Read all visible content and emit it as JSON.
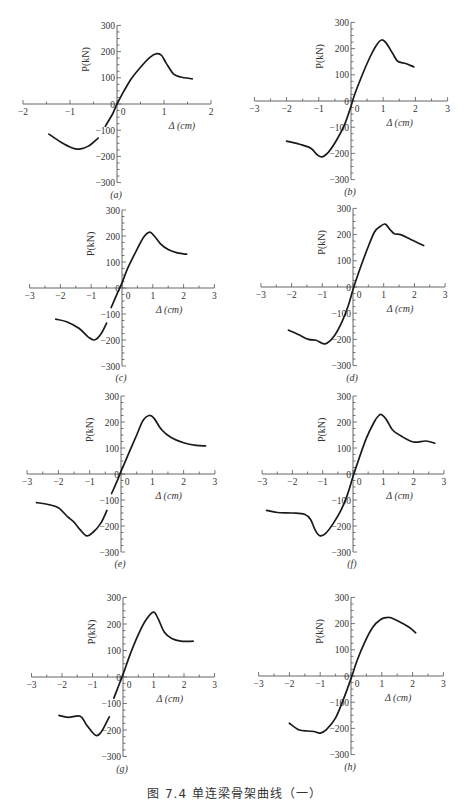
{
  "figure": {
    "caption": "图 7.4  单连梁骨架曲线（一）"
  },
  "chart_data": [
    {
      "panel": "(a)",
      "type": "line",
      "xlabel": "Δ (cm)",
      "ylabel": "P(kN)",
      "xlim": [
        -2,
        2
      ],
      "ylim": [
        -300,
        300
      ],
      "xticks": [
        -2,
        -1,
        0,
        1,
        2
      ],
      "yticks": [
        300,
        200,
        100,
        0,
        -100,
        -200,
        -300
      ],
      "grid": false,
      "frame": {
        "ox": 117,
        "oy": 104,
        "sx": 47,
        "sy": 0.262
      },
      "segments": [
        [
          [
            -1.45,
            -115
          ],
          [
            -1.2,
            -145
          ],
          [
            -0.95,
            -168
          ],
          [
            -0.8,
            -172
          ],
          [
            -0.6,
            -160
          ],
          [
            -0.4,
            -130
          ]
        ],
        [
          [
            -0.25,
            -85
          ],
          [
            -0.1,
            -40
          ],
          [
            0,
            0
          ],
          [
            0.15,
            50
          ],
          [
            0.3,
            95
          ],
          [
            0.5,
            140
          ],
          [
            0.7,
            178
          ],
          [
            0.85,
            192
          ],
          [
            0.95,
            185
          ],
          [
            1.05,
            155
          ],
          [
            1.2,
            115
          ],
          [
            1.35,
            103
          ],
          [
            1.6,
            96
          ]
        ]
      ]
    },
    {
      "panel": "(b)",
      "type": "line",
      "xlabel": "Δ (cm)",
      "ylabel": "P(kN)",
      "xlim": [
        -3,
        3
      ],
      "ylim": [
        -300,
        300
      ],
      "xticks": [
        -3,
        -2,
        -1,
        0,
        1,
        2,
        3
      ],
      "yticks": [
        300,
        200,
        100,
        0,
        -100,
        -200,
        -300
      ],
      "grid": false,
      "frame": {
        "ox": 351,
        "oy": 101,
        "sx": 32.2,
        "sy": 0.262
      },
      "segments": [
        [
          [
            -2,
            -153
          ],
          [
            -1.6,
            -165
          ],
          [
            -1.25,
            -180
          ],
          [
            -1.05,
            -205
          ],
          [
            -0.9,
            -213
          ],
          [
            -0.7,
            -195
          ],
          [
            -0.45,
            -150
          ],
          [
            -0.2,
            -90
          ],
          [
            0,
            -20
          ],
          [
            0.1,
            20
          ],
          [
            0.3,
            85
          ],
          [
            0.6,
            170
          ],
          [
            0.8,
            215
          ],
          [
            0.95,
            233
          ],
          [
            1.1,
            220
          ],
          [
            1.3,
            180
          ],
          [
            1.45,
            152
          ],
          [
            1.7,
            143
          ],
          [
            1.95,
            130
          ]
        ]
      ]
    },
    {
      "panel": "(c)",
      "type": "line",
      "xlabel": "Δ (cm)",
      "ylabel": "P(kN)",
      "xlim": [
        -3,
        3
      ],
      "ylim": [
        -300,
        300
      ],
      "xticks": [
        -3,
        -2,
        -1,
        0,
        1,
        2,
        3
      ],
      "yticks": [
        300,
        200,
        100,
        0,
        -100,
        -200,
        -300
      ],
      "grid": false,
      "frame": {
        "ox": 122,
        "oy": 288,
        "sx": 30.8,
        "sy": 0.26
      },
      "segments": [
        [
          [
            -2.15,
            -120
          ],
          [
            -1.8,
            -130
          ],
          [
            -1.4,
            -155
          ],
          [
            -1.1,
            -188
          ],
          [
            -0.9,
            -200
          ],
          [
            -0.7,
            -180
          ],
          [
            -0.5,
            -135
          ]
        ],
        [
          [
            -0.35,
            -75
          ],
          [
            -0.15,
            -20
          ],
          [
            0,
            20
          ],
          [
            0.2,
            80
          ],
          [
            0.45,
            140
          ],
          [
            0.7,
            195
          ],
          [
            0.9,
            215
          ],
          [
            1.05,
            200
          ],
          [
            1.25,
            170
          ],
          [
            1.5,
            148
          ],
          [
            1.8,
            135
          ],
          [
            2.1,
            130
          ]
        ]
      ]
    },
    {
      "panel": "(d)",
      "type": "line",
      "xlabel": "Δ (cm)",
      "ylabel": "P(kN)",
      "xlim": [
        -3,
        3
      ],
      "ylim": [
        -300,
        300
      ],
      "xticks": [
        -3,
        -2,
        -1,
        0,
        1,
        2,
        3
      ],
      "yticks": [
        300,
        200,
        100,
        0,
        -100,
        -200,
        -300
      ],
      "grid": false,
      "frame": {
        "ox": 353,
        "oy": 287,
        "sx": 30.7,
        "sy": 0.262
      },
      "segments": [
        [
          [
            -2.1,
            -165
          ],
          [
            -1.8,
            -180
          ],
          [
            -1.45,
            -200
          ],
          [
            -1.2,
            -203
          ],
          [
            -1.0,
            -215
          ],
          [
            -0.85,
            -215
          ],
          [
            -0.6,
            -185
          ],
          [
            -0.35,
            -130
          ],
          [
            -0.15,
            -70
          ],
          [
            0,
            -10
          ],
          [
            0.2,
            60
          ],
          [
            0.45,
            140
          ],
          [
            0.7,
            210
          ],
          [
            0.9,
            232
          ],
          [
            1.05,
            240
          ],
          [
            1.2,
            220
          ],
          [
            1.35,
            203
          ],
          [
            1.55,
            200
          ],
          [
            1.9,
            180
          ],
          [
            2.3,
            158
          ]
        ]
      ]
    },
    {
      "panel": "(e)",
      "type": "line",
      "xlabel": "Δ (cm)",
      "ylabel": "P(kN)",
      "xlim": [
        -3,
        3
      ],
      "ylim": [
        -300,
        300
      ],
      "xticks": [
        -3,
        -2,
        -1,
        0,
        1,
        2,
        3
      ],
      "yticks": [
        300,
        200,
        100,
        0,
        -100,
        -200,
        -300
      ],
      "grid": false,
      "frame": {
        "ox": 121,
        "oy": 474,
        "sx": 31.3,
        "sy": 0.26
      },
      "segments": [
        [
          [
            -2.7,
            -110
          ],
          [
            -2.3,
            -118
          ],
          [
            -2.0,
            -130
          ],
          [
            -1.7,
            -165
          ],
          [
            -1.5,
            -185
          ],
          [
            -1.3,
            -215
          ],
          [
            -1.1,
            -238
          ],
          [
            -0.9,
            -225
          ],
          [
            -0.65,
            -190
          ],
          [
            -0.45,
            -140
          ]
        ],
        [
          [
            -0.3,
            -75
          ],
          [
            -0.1,
            -20
          ],
          [
            0,
            10
          ],
          [
            0.25,
            80
          ],
          [
            0.5,
            150
          ],
          [
            0.7,
            205
          ],
          [
            0.9,
            225
          ],
          [
            1.05,
            215
          ],
          [
            1.3,
            170
          ],
          [
            1.6,
            140
          ],
          [
            2.0,
            120
          ],
          [
            2.4,
            110
          ],
          [
            2.7,
            108
          ]
        ]
      ]
    },
    {
      "panel": "(f)",
      "type": "line",
      "xlabel": "Δ (cm)",
      "ylabel": "P(kN)",
      "xlim": [
        -3,
        3
      ],
      "ylim": [
        -300,
        300
      ],
      "xticks": [
        -3,
        -2,
        -1,
        0,
        1,
        2,
        3
      ],
      "yticks": [
        300,
        200,
        100,
        0,
        -100,
        -200,
        -300
      ],
      "grid": false,
      "frame": {
        "ox": 353,
        "oy": 474,
        "sx": 30.3,
        "sy": 0.26
      },
      "segments": [
        [
          [
            -2.85,
            -140
          ],
          [
            -2.5,
            -148
          ],
          [
            -2.0,
            -150
          ],
          [
            -1.6,
            -155
          ],
          [
            -1.4,
            -175
          ],
          [
            -1.25,
            -215
          ],
          [
            -1.1,
            -237
          ],
          [
            -0.9,
            -228
          ],
          [
            -0.65,
            -190
          ],
          [
            -0.4,
            -140
          ],
          [
            -0.2,
            -85
          ],
          [
            0,
            -10
          ],
          [
            0.2,
            60
          ],
          [
            0.45,
            140
          ],
          [
            0.7,
            200
          ],
          [
            0.85,
            225
          ],
          [
            0.95,
            228
          ],
          [
            1.1,
            210
          ],
          [
            1.3,
            170
          ],
          [
            1.6,
            145
          ],
          [
            2.0,
            123
          ],
          [
            2.4,
            127
          ],
          [
            2.7,
            118
          ]
        ]
      ]
    },
    {
      "panel": "(g)",
      "type": "line",
      "xlabel": "Δ (cm)",
      "ylabel": "P(kN)",
      "xlim": [
        -3,
        3
      ],
      "ylim": [
        -300,
        300
      ],
      "xticks": [
        -3,
        -2,
        -1,
        0,
        1,
        2,
        3
      ],
      "yticks": [
        300,
        200,
        100,
        0,
        -100,
        -200,
        -300
      ],
      "grid": false,
      "frame": {
        "ox": 123,
        "oy": 677,
        "sx": 30.5,
        "sy": 0.265
      },
      "segments": [
        [
          [
            -2.1,
            -145
          ],
          [
            -1.8,
            -152
          ],
          [
            -1.4,
            -148
          ],
          [
            -1.2,
            -180
          ],
          [
            -0.9,
            -220
          ],
          [
            -0.7,
            -205
          ],
          [
            -0.45,
            -150
          ]
        ],
        [
          [
            -0.3,
            -80
          ],
          [
            -0.1,
            -20
          ],
          [
            0,
            10
          ],
          [
            0.25,
            90
          ],
          [
            0.5,
            160
          ],
          [
            0.75,
            215
          ],
          [
            1.0,
            245
          ],
          [
            1.15,
            220
          ],
          [
            1.35,
            170
          ],
          [
            1.6,
            145
          ],
          [
            1.9,
            135
          ],
          [
            2.3,
            135
          ]
        ]
      ]
    },
    {
      "panel": "(h)",
      "type": "line",
      "xlabel": "Δ (cm)",
      "ylabel": "P(kN)",
      "xlim": [
        -3,
        3
      ],
      "ylim": [
        -300,
        300
      ],
      "xticks": [
        -3,
        -2,
        -1,
        0,
        1,
        2,
        3
      ],
      "yticks": [
        300,
        200,
        100,
        0,
        -100,
        -200,
        -300
      ],
      "grid": false,
      "frame": {
        "ox": 351,
        "oy": 676,
        "sx": 30.8,
        "sy": 0.262
      },
      "segments": [
        [
          [
            -2.0,
            -180
          ],
          [
            -1.7,
            -205
          ],
          [
            -1.4,
            -210
          ],
          [
            -1.2,
            -212
          ],
          [
            -1.0,
            -218
          ],
          [
            -0.8,
            -205
          ],
          [
            -0.5,
            -160
          ],
          [
            -0.25,
            -90
          ],
          [
            0,
            -10
          ],
          [
            0.2,
            60
          ],
          [
            0.45,
            130
          ],
          [
            0.7,
            185
          ],
          [
            0.95,
            215
          ],
          [
            1.15,
            223
          ],
          [
            1.3,
            222
          ],
          [
            1.6,
            205
          ],
          [
            1.9,
            185
          ],
          [
            2.1,
            165
          ]
        ]
      ]
    }
  ]
}
